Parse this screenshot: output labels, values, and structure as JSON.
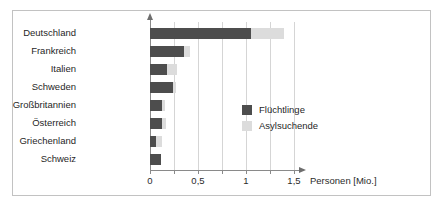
{
  "chart_data": {
    "type": "bar",
    "orientation": "horizontal",
    "stacked": true,
    "title": "",
    "xlabel": "Personen [Mio.]",
    "ylabel": "",
    "xlim": [
      0,
      1.55
    ],
    "grid": true,
    "grid_axis": "x",
    "legend_position": "center-right",
    "categories": [
      "Deutschland",
      "Frankreich",
      "Italien",
      "Schweden",
      "Großbritannien",
      "Österreich",
      "Griechenland",
      "Schweiz"
    ],
    "tick_values": [
      0,
      0.25,
      0.5,
      0.75,
      1,
      1.25,
      1.5
    ],
    "tick_labels": [
      "0",
      "",
      "0,5",
      "",
      "1",
      "",
      "1,5"
    ],
    "series": [
      {
        "name": "Flüchtlinge",
        "color": "#4d4d4d",
        "values": [
          1.05,
          0.35,
          0.18,
          0.24,
          0.12,
          0.13,
          0.06,
          0.11
        ]
      },
      {
        "name": "Asylsuchende",
        "color": "#dcdcdc",
        "values": [
          0.35,
          0.07,
          0.1,
          0.03,
          0.04,
          0.04,
          0.07,
          0.0
        ]
      }
    ]
  },
  "legend": {
    "items": [
      {
        "label": "Flüchtlinge",
        "swatch": "dark"
      },
      {
        "label": "Asylsuchende",
        "swatch": "light"
      }
    ]
  },
  "axis": {
    "x_title": "Personen [Mio.]"
  }
}
